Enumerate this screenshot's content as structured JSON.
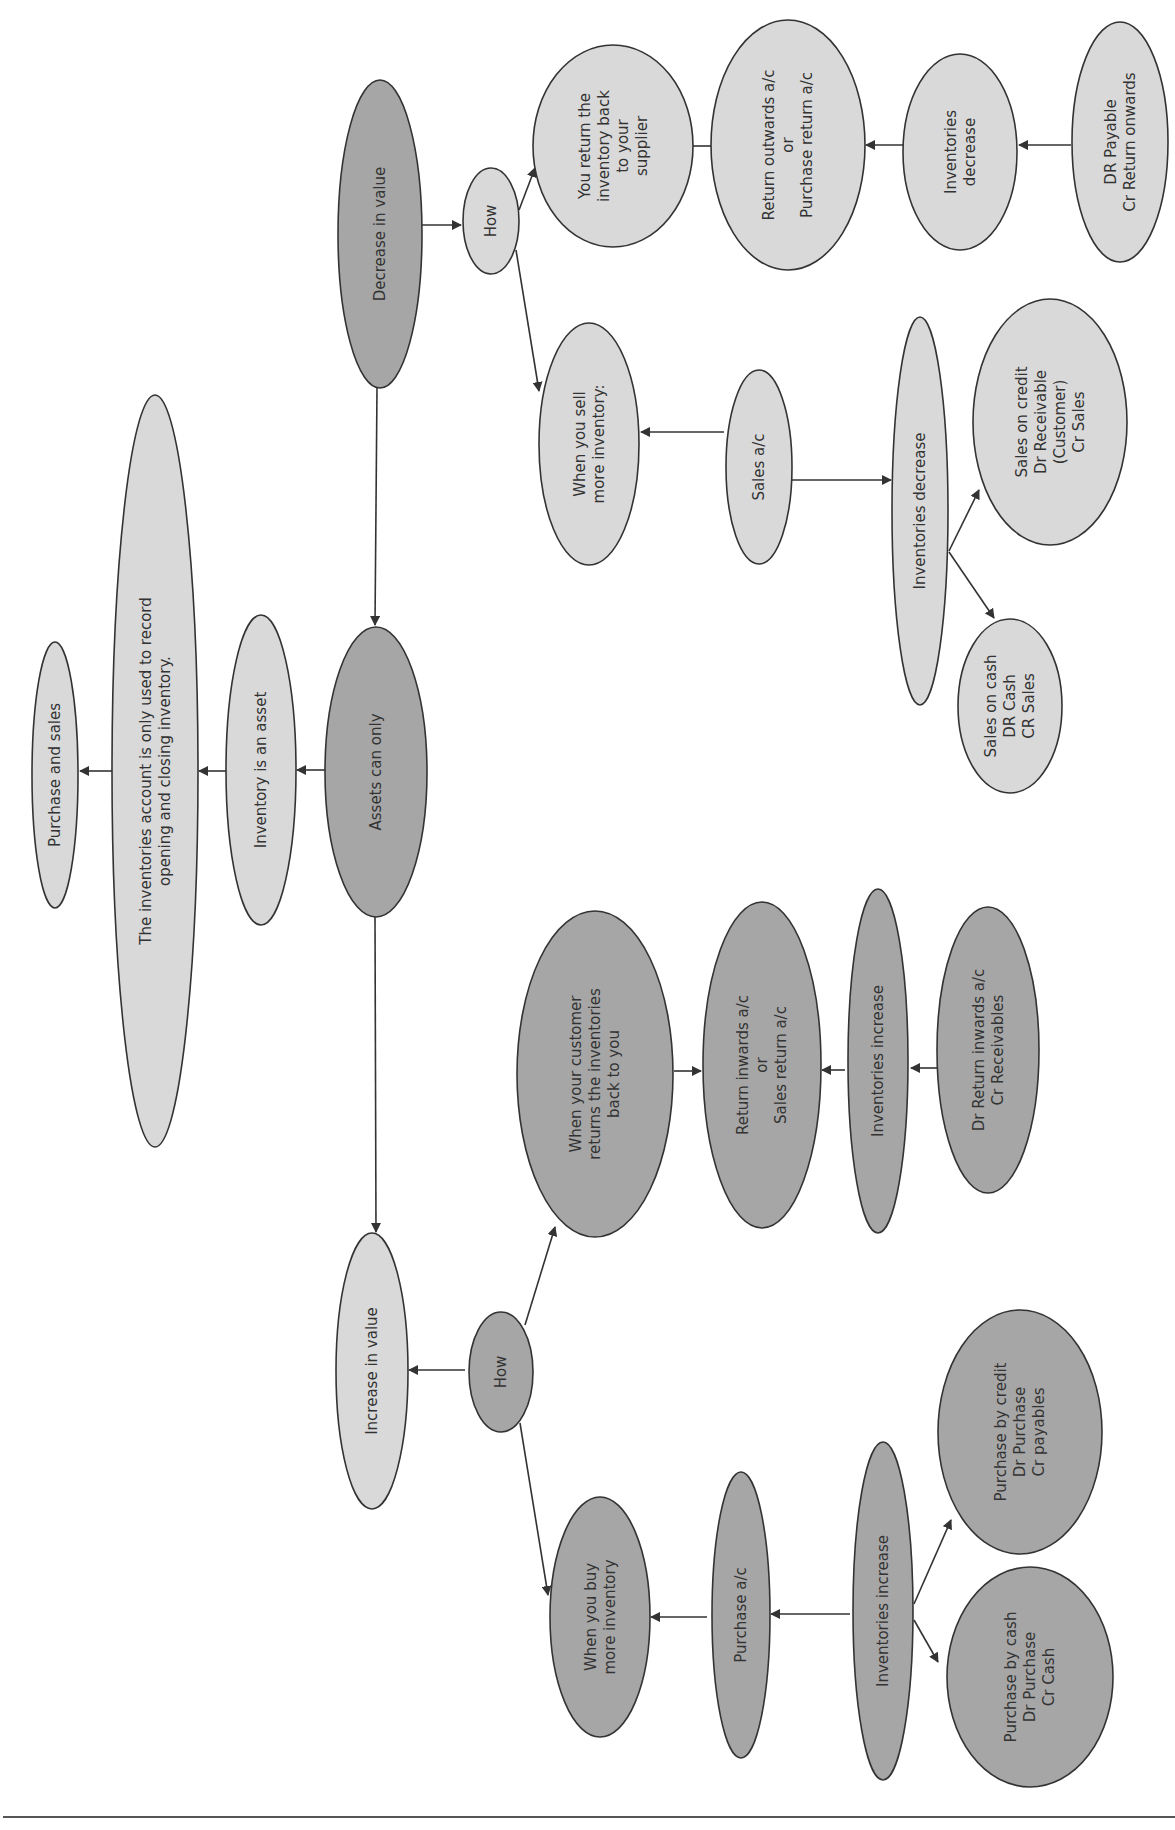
{
  "diagram": {
    "colors": {
      "light_fill": "#d9d9d9",
      "dark_fill": "#a6a6a6",
      "stroke": "#333333",
      "text": "#333333"
    },
    "text_rotation_deg": -90,
    "nodes": [
      {
        "id": "purchase_and_sales",
        "lines": [
          "Purchase and sales"
        ],
        "fill": "light",
        "cx": 55,
        "cy": 775,
        "rx": 23,
        "ry": 133
      },
      {
        "id": "inventories_note",
        "lines": [
          "The inventories account is only used to record",
          "opening and closing inventory."
        ],
        "fill": "light",
        "cx": 155,
        "cy": 771,
        "rx": 43,
        "ry": 376
      },
      {
        "id": "inventory_is_asset",
        "lines": [
          "Inventory is an asset"
        ],
        "fill": "light",
        "cx": 261,
        "cy": 770,
        "rx": 35,
        "ry": 155
      },
      {
        "id": "assets_can_only",
        "lines": [
          "Assets can only"
        ],
        "fill": "dark",
        "cx": 376,
        "cy": 772,
        "rx": 51,
        "ry": 145
      },
      {
        "id": "decrease_in_value",
        "lines": [
          "Decrease in value"
        ],
        "fill": "dark",
        "cx": 380,
        "cy": 234,
        "rx": 42,
        "ry": 154
      },
      {
        "id": "how_decrease",
        "lines": [
          "How"
        ],
        "fill": "light",
        "cx": 491,
        "cy": 221,
        "rx": 28,
        "ry": 53
      },
      {
        "id": "you_return_inventory",
        "lines": [
          "You return the",
          "inventory back",
          "to your",
          "supplier"
        ],
        "fill": "light",
        "cx": 613,
        "cy": 146,
        "rx": 80,
        "ry": 101
      },
      {
        "id": "return_outwards",
        "lines": [
          "Return outwards a/c",
          "or",
          "Purchase return a/c"
        ],
        "fill": "light",
        "cx": 788,
        "cy": 145,
        "rx": 77,
        "ry": 125
      },
      {
        "id": "inventories_decrease_return",
        "lines": [
          "Inventories",
          "decrease"
        ],
        "fill": "light",
        "cx": 960,
        "cy": 152,
        "rx": 57,
        "ry": 98
      },
      {
        "id": "dr_payable",
        "lines": [
          "DR Payable",
          "Cr Return onwards"
        ],
        "fill": "light",
        "cx": 1120,
        "cy": 142,
        "rx": 48,
        "ry": 120
      },
      {
        "id": "when_you_sell",
        "lines": [
          "When you sell",
          "more inventory:"
        ],
        "fill": "light",
        "cx": 589,
        "cy": 444,
        "rx": 50,
        "ry": 121
      },
      {
        "id": "sales_ac",
        "lines": [
          "Sales a/c"
        ],
        "fill": "light",
        "cx": 759,
        "cy": 467,
        "rx": 33,
        "ry": 97
      },
      {
        "id": "inventories_decrease_sales",
        "lines": [
          "Inventories decrease"
        ],
        "fill": "light",
        "cx": 920,
        "cy": 511,
        "rx": 28,
        "ry": 194
      },
      {
        "id": "sales_on_credit",
        "lines": [
          "Sales on credit",
          "Dr Receivable",
          "(Customer)",
          "Cr Sales"
        ],
        "fill": "light",
        "cx": 1050,
        "cy": 422,
        "rx": 77,
        "ry": 123
      },
      {
        "id": "sales_on_cash",
        "lines": [
          "Sales on cash",
          "DR Cash",
          "CR Sales"
        ],
        "fill": "light",
        "cx": 1010,
        "cy": 706,
        "rx": 52,
        "ry": 87
      },
      {
        "id": "increase_in_value",
        "lines": [
          "Increase in value"
        ],
        "fill": "light",
        "cx": 372,
        "cy": 1371,
        "rx": 36,
        "ry": 138
      },
      {
        "id": "how_increase",
        "lines": [
          "How"
        ],
        "fill": "dark",
        "cx": 501,
        "cy": 1372,
        "rx": 32,
        "ry": 60
      },
      {
        "id": "when_customer_returns",
        "lines": [
          "When your customer",
          "returns the inventories",
          "back to you"
        ],
        "fill": "dark",
        "cx": 595,
        "cy": 1074,
        "rx": 78,
        "ry": 163
      },
      {
        "id": "return_inwards",
        "lines": [
          "Return inwards a/c",
          "or",
          "Sales return a/c"
        ],
        "fill": "dark",
        "cx": 762,
        "cy": 1065,
        "rx": 59,
        "ry": 163
      },
      {
        "id": "inventories_increase_return",
        "lines": [
          "Inventories increase"
        ],
        "fill": "dark",
        "cx": 878,
        "cy": 1061,
        "rx": 30,
        "ry": 172
      },
      {
        "id": "dr_return_inwards",
        "lines": [
          "Dr Return inwards a/c",
          "Cr Receivables"
        ],
        "fill": "dark",
        "cx": 988,
        "cy": 1050,
        "rx": 51,
        "ry": 143
      },
      {
        "id": "when_you_buy",
        "lines": [
          "When you buy",
          "more inventory"
        ],
        "fill": "dark",
        "cx": 600,
        "cy": 1617,
        "rx": 50,
        "ry": 120
      },
      {
        "id": "purchase_ac",
        "lines": [
          "Purchase a/c"
        ],
        "fill": "dark",
        "cx": 741,
        "cy": 1615,
        "rx": 29,
        "ry": 143
      },
      {
        "id": "inventories_increase_purchase",
        "lines": [
          "Inventories increase"
        ],
        "fill": "dark",
        "cx": 883,
        "cy": 1611,
        "rx": 30,
        "ry": 169
      },
      {
        "id": "purchase_by_credit",
        "lines": [
          "Purchase by credit",
          "Dr Purchase",
          "Cr payables"
        ],
        "fill": "dark",
        "cx": 1020,
        "cy": 1432,
        "rx": 82,
        "ry": 122
      },
      {
        "id": "purchase_by_cash",
        "lines": [
          "Purchase by cash",
          "Dr Purchase",
          "Cr Cash"
        ],
        "fill": "dark",
        "cx": 1030,
        "cy": 1677,
        "rx": 83,
        "ry": 110
      }
    ],
    "edges": [
      {
        "from": "inventories_note",
        "to": "purchase_and_sales",
        "points": [
          [
            112,
            771
          ],
          [
            80,
            771
          ]
        ]
      },
      {
        "from": "inventory_is_asset",
        "to": "inventories_note",
        "points": [
          [
            226,
            771
          ],
          [
            199,
            771
          ]
        ]
      },
      {
        "from": "assets_can_only",
        "to": "inventory_is_asset",
        "points": [
          [
            325,
            770
          ],
          [
            297,
            770
          ]
        ]
      },
      {
        "from": "decrease_in_value",
        "to": "assets_can_only",
        "points": [
          [
            377,
            388
          ],
          [
            375,
            625
          ]
        ]
      },
      {
        "from": "assets_can_only",
        "to": "increase_in_value",
        "points": [
          [
            375,
            917
          ],
          [
            376,
            1232
          ]
        ]
      },
      {
        "from": "decrease_in_value",
        "to": "how_decrease",
        "points": [
          [
            422,
            225
          ],
          [
            461,
            225
          ]
        ]
      },
      {
        "from": "how_decrease",
        "to": "you_return_inventory",
        "points": [
          [
            519,
            210
          ],
          [
            535,
            168
          ]
        ]
      },
      {
        "from": "how_decrease",
        "to": "when_you_sell",
        "points": [
          [
            516,
            250
          ],
          [
            539,
            391
          ]
        ]
      },
      {
        "from": "you_return_inventory",
        "to": "return_outwards",
        "points": [
          [
            693,
            146
          ],
          [
            720,
            146
          ]
        ]
      },
      {
        "from": "inventories_decrease_return",
        "to": "return_outwards",
        "points": [
          [
            903,
            145
          ],
          [
            866,
            145
          ]
        ]
      },
      {
        "from": "dr_payable",
        "to": "inventories_decrease_return",
        "points": [
          [
            1071,
            145
          ],
          [
            1019,
            145
          ]
        ]
      },
      {
        "from": "sales_ac",
        "to": "when_you_sell",
        "points": [
          [
            724,
            432
          ],
          [
            641,
            432
          ]
        ]
      },
      {
        "from": "sales_ac",
        "to": "inventories_decrease_sales",
        "points": [
          [
            792,
            480
          ],
          [
            891,
            480
          ]
        ]
      },
      {
        "from": "inventories_decrease_sales",
        "to": "sales_on_credit",
        "points": [
          [
            949,
            551
          ],
          [
            979,
            490
          ]
        ]
      },
      {
        "from": "inventories_decrease_sales",
        "to": "sales_on_cash",
        "points": [
          [
            949,
            552
          ],
          [
            994,
            618
          ]
        ]
      },
      {
        "from": "how_increase",
        "to": "increase_in_value",
        "points": [
          [
            465,
            1370
          ],
          [
            409,
            1370
          ]
        ]
      },
      {
        "from": "how_increase",
        "to": "when_customer_returns",
        "points": [
          [
            525,
            1325
          ],
          [
            555,
            1227
          ]
        ]
      },
      {
        "from": "how_increase",
        "to": "when_you_buy",
        "points": [
          [
            520,
            1423
          ],
          [
            548,
            1595
          ]
        ]
      },
      {
        "from": "when_customer_returns",
        "to": "return_inwards",
        "points": [
          [
            674,
            1071
          ],
          [
            701,
            1071
          ]
        ]
      },
      {
        "from": "inventories_increase_return",
        "to": "return_inwards",
        "points": [
          [
            845,
            1070
          ],
          [
            822,
            1070
          ]
        ]
      },
      {
        "from": "dr_return_inwards",
        "to": "inventories_increase_return",
        "points": [
          [
            937,
            1068
          ],
          [
            911,
            1068
          ]
        ]
      },
      {
        "from": "purchase_ac",
        "to": "when_you_buy",
        "points": [
          [
            707,
            1617
          ],
          [
            651,
            1617
          ]
        ]
      },
      {
        "from": "inventories_increase_purchase",
        "to": "purchase_ac",
        "points": [
          [
            850,
            1614
          ],
          [
            771,
            1614
          ]
        ]
      },
      {
        "from": "inventories_increase_purchase",
        "to": "purchase_by_credit",
        "points": [
          [
            914,
            1604
          ],
          [
            951,
            1520
          ]
        ]
      },
      {
        "from": "inventories_increase_purchase",
        "to": "purchase_by_cash",
        "points": [
          [
            914,
            1620
          ],
          [
            938,
            1662
          ]
        ]
      }
    ],
    "footer_rule": {
      "x1": 3,
      "y1": 1817,
      "x2": 1175,
      "y2": 1817
    }
  }
}
